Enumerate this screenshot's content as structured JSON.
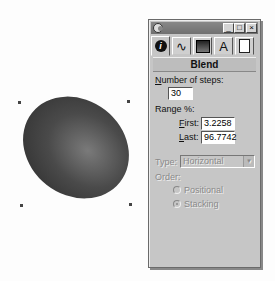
{
  "canvas": {
    "shape": "blended-ellipse",
    "fill_color_dark": "#2a2a2a",
    "fill_color_light": "#7a7a7a"
  },
  "panel": {
    "title": "",
    "title_buttons": {
      "minimize": "_",
      "maximize": "□",
      "close": "×"
    },
    "tabs": [
      {
        "icon": "info-icon",
        "glyph": "i",
        "active": true
      },
      {
        "icon": "curve-icon",
        "glyph": "∿",
        "active": false
      },
      {
        "icon": "fill-icon",
        "glyph": "■",
        "active": false
      },
      {
        "icon": "text-icon",
        "glyph": "A",
        "active": false
      },
      {
        "icon": "page-icon",
        "glyph": "▯",
        "active": false
      }
    ],
    "heading": "Blend",
    "steps": {
      "label_prefix": "N",
      "label_rest": "umber of steps:",
      "value": "30"
    },
    "range": {
      "label": "Range %:",
      "first": {
        "label_prefix": "F",
        "label_rest": "irst:",
        "value": "3.2258"
      },
      "last": {
        "label_prefix": "L",
        "label_rest": "ast:",
        "value": "96.7742"
      }
    },
    "type": {
      "label": "Type:",
      "value": "Horizontal",
      "arrow": "▼"
    },
    "order": {
      "label": "Order:",
      "options": [
        {
          "label": "Positional",
          "checked": false
        },
        {
          "label": "Stacking",
          "checked": true
        }
      ]
    }
  }
}
